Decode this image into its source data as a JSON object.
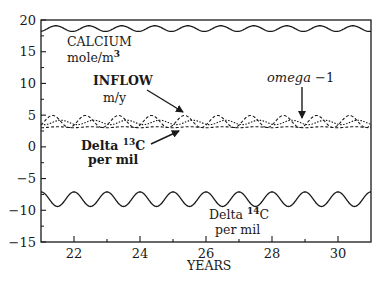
{
  "chart_data": {
    "type": "line",
    "title": "",
    "xlabel": "YEARS",
    "ylabel": "",
    "xlim": [
      21,
      31
    ],
    "ylim": [
      -15,
      20
    ],
    "grid": false,
    "x_ticks": [
      22,
      24,
      26,
      28,
      30
    ],
    "x_tick_labels": [
      "22",
      "24",
      "26",
      "28",
      "30"
    ],
    "y_ticks": [
      -15,
      -10,
      -5,
      0,
      5,
      10,
      15,
      20
    ],
    "y_tick_labels": [
      "-15",
      "-10",
      "-5",
      "0",
      "5",
      "10",
      "15",
      "20"
    ],
    "series": [
      {
        "name": "CALCIUM mole/m3",
        "style": "solid",
        "mean": 18.65,
        "amplitude": 0.45,
        "period_years": 1.0,
        "phase_peak_year": 21.45
      },
      {
        "name": "INFLOW m/y",
        "style": "dashed",
        "mean": 4.0,
        "amplitude": 0.95,
        "period_years": 1.0,
        "phase_peak_year": 21.35
      },
      {
        "name": "omega -1",
        "style": "dotted",
        "mean": 3.85,
        "amplitude": 0.35,
        "period_years": 1.0,
        "phase_peak_year": 21.6
      },
      {
        "name": "Delta 13C per mil",
        "style": "dashed",
        "mean": 3.1,
        "amplitude": 0.08,
        "period_years": 1.0,
        "phase_peak_year": 21.5
      },
      {
        "name": "Delta 14C per mil",
        "style": "solid",
        "mean": -8.25,
        "amplitude": 1.15,
        "period_years": 1.0,
        "phase_peak_year": 22.0
      }
    ],
    "annotations": [
      {
        "text": "CALCIUM",
        "line2": "mole/m",
        "sup": "3"
      },
      {
        "text": "INFLOW",
        "line2": "m/y"
      },
      {
        "text": "omega -1"
      },
      {
        "text": "Delta",
        "sup": "13",
        "suffix": "C",
        "line2": "per mil"
      },
      {
        "text": "Delta",
        "sup": "14",
        "suffix": "C",
        "line2": "per mil"
      }
    ]
  },
  "labels": {
    "calcium_1": "CALCIUM",
    "calcium_2": "mole/m",
    "calcium_sup": "3",
    "inflow_1": "INFLOW",
    "inflow_2": "m/y",
    "omega": "omega",
    "omega_suffix": " −1",
    "c13_1": "Delta ",
    "c13_sup": "13",
    "c13_c": "C",
    "c13_2": "per mil",
    "c14_1": "Delta ",
    "c14_sup": "14",
    "c14_c": "C",
    "c14_2": "per mil",
    "xlabel": "YEARS"
  },
  "colors": {
    "ink": "#1a1a1a",
    "background": "#ffffff"
  }
}
